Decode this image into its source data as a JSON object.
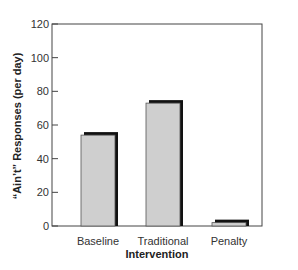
{
  "chart_data": {
    "type": "bar",
    "title": "",
    "xlabel": "Intervention",
    "ylabel": "“Ain’t” Responses (per day)",
    "categories": [
      "Baseline",
      "Traditional",
      "Penalty"
    ],
    "values": [
      54,
      73,
      2
    ],
    "ylim": [
      0,
      120
    ],
    "yticks": [
      0,
      20,
      40,
      60,
      80,
      100,
      120
    ],
    "grid": false,
    "legend": null
  },
  "style": {
    "bar_fill": "#cfcfcf",
    "bar_shadow": "#111111",
    "frame": "#444444"
  }
}
